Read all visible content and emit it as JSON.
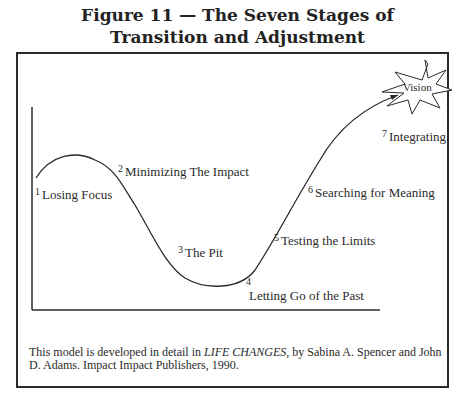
{
  "figure": {
    "title_line1": "Figure 11 — The Seven Stages of",
    "title_line2": "Transition and Adjustment"
  },
  "stages": [
    {
      "number": "1",
      "label": "Losing Focus"
    },
    {
      "number": "2",
      "label": "Minimizing The Impact"
    },
    {
      "number": "3",
      "label": "The Pit"
    },
    {
      "number": "4",
      "label": "Letting Go of the Past"
    },
    {
      "number": "5",
      "label": "Testing the Limits"
    },
    {
      "number": "6",
      "label": "Searching for Meaning"
    },
    {
      "number": "7",
      "label": "Integrating"
    }
  ],
  "vision": {
    "label": "Vision"
  },
  "caption": {
    "prefix": "This model is developed in detail in ",
    "book_title": "LIFE CHANGES",
    "suffix": ", by Sabina A. Spencer and John D. Adams. Impact Impact Publishers, 1990."
  }
}
